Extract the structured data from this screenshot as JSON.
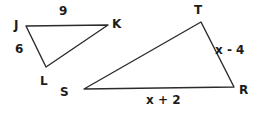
{
  "figure": {
    "background_color": "#ffffff",
    "stroke_color": "#2b2b2b",
    "text_color": "#1c1c1c",
    "stroke_width": 1.4,
    "width": 257,
    "height": 113
  },
  "triangles": [
    {
      "name": "JKL",
      "vertices": [
        {
          "label": "J",
          "x": 26,
          "y": 26,
          "label_x": 14,
          "label_y": 19
        },
        {
          "label": "K",
          "x": 108,
          "y": 25,
          "label_x": 112,
          "label_y": 18
        },
        {
          "label": "L",
          "x": 46,
          "y": 67,
          "label_x": 40,
          "label_y": 75
        }
      ],
      "sides": [
        {
          "label": "9",
          "from": "J",
          "to": "K",
          "label_x": 59,
          "label_y": 5
        },
        {
          "label": "6",
          "from": "J",
          "to": "L",
          "label_x": 15,
          "label_y": 43
        }
      ]
    },
    {
      "name": "STR",
      "vertices": [
        {
          "label": "T",
          "x": 201,
          "y": 22,
          "label_x": 194,
          "label_y": 4
        },
        {
          "label": "R",
          "x": 234,
          "y": 87,
          "label_x": 239,
          "label_y": 84
        },
        {
          "label": "S",
          "x": 84,
          "y": 89,
          "label_x": 60,
          "label_y": 86
        }
      ],
      "sides": [
        {
          "label": "x - 4",
          "from": "T",
          "to": "R",
          "label_x": 215,
          "label_y": 44
        },
        {
          "label": "x + 2",
          "from": "S",
          "to": "R",
          "label_x": 146,
          "label_y": 94
        }
      ]
    }
  ]
}
